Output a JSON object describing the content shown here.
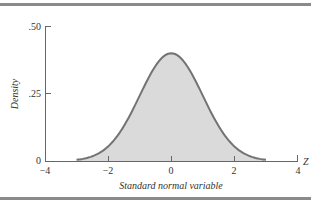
{
  "chart_data": {
    "type": "area",
    "title": "",
    "xlabel": "Standard normal variable",
    "ylabel": "Density",
    "x_axis_end_label": "Z",
    "xlim": [
      -4,
      4
    ],
    "ylim": [
      0,
      0.5
    ],
    "x_ticks": [
      "-4",
      "-2",
      "0",
      "2",
      "4"
    ],
    "y_ticks": [
      "0",
      ".25",
      ".50"
    ],
    "curve": "standard normal pdf, plotted from -3 to 3",
    "series": [
      {
        "name": "Standard normal density",
        "x": [
          -3,
          -2.5,
          -2,
          -1.5,
          -1,
          -0.5,
          0,
          0.5,
          1,
          1.5,
          2,
          2.5,
          3
        ],
        "values": [
          0.004,
          0.018,
          0.054,
          0.13,
          0.242,
          0.352,
          0.399,
          0.352,
          0.242,
          0.13,
          0.054,
          0.018,
          0.004
        ]
      }
    ],
    "grid": false,
    "legend": "none",
    "colors": {
      "fill": "#d9d9d9",
      "line": "#707070",
      "axis": "#555555"
    }
  },
  "labels": {
    "y_top": ".50",
    "y_mid": ".25",
    "y_zero": "0",
    "x_m4": "−4",
    "x_m2": "−2",
    "x_0": "0",
    "x_2": "2",
    "x_4": "4",
    "z": "Z",
    "xlabel": "Standard normal variable",
    "ylabel": "Density"
  }
}
